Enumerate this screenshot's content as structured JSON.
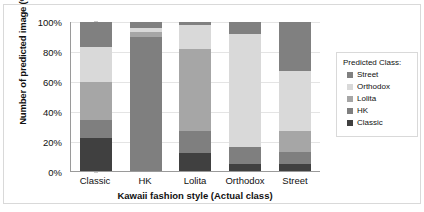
{
  "chart_data": {
    "type": "bar",
    "stacked": true,
    "stack_mode": "percent",
    "title": "",
    "xlabel": "Kawaii fashion style (Actual class)",
    "ylabel": "Number of predicted image (%)",
    "categories": [
      "Classic",
      "HK",
      "Lolita",
      "Orthodox",
      "Street"
    ],
    "ylim": [
      0,
      100
    ],
    "ytick_labels": [
      "0%",
      "20%",
      "40%",
      "60%",
      "80%",
      "100%"
    ],
    "ytick_values": [
      0,
      20,
      40,
      60,
      80,
      100
    ],
    "grid": true,
    "legend_position": "right",
    "legend_title": "Predicted Class:",
    "series": [
      {
        "name": "Classic",
        "color": "#404040",
        "values": [
          22,
          0,
          12,
          5,
          5
        ]
      },
      {
        "name": "HK",
        "color": "#7f7f7f",
        "values": [
          12,
          90,
          15,
          11,
          8
        ]
      },
      {
        "name": "Lolita",
        "color": "#a6a6a6",
        "values": [
          26,
          3,
          55,
          0,
          14
        ]
      },
      {
        "name": "Orthodox",
        "color": "#d9d9d9",
        "values": [
          23,
          3,
          16,
          76,
          40
        ]
      },
      {
        "name": "Street",
        "color": "#808080",
        "values": [
          17,
          4,
          2,
          8,
          33
        ]
      }
    ],
    "legend_order": [
      "Street",
      "Orthodox",
      "Lolita",
      "HK",
      "Classic"
    ]
  },
  "legend": {
    "title": "Predicted Class:",
    "items": [
      {
        "label": "Street",
        "color": "#808080"
      },
      {
        "label": "Orthodox",
        "color": "#d9d9d9"
      },
      {
        "label": "Lolita",
        "color": "#a6a6a6"
      },
      {
        "label": "HK",
        "color": "#7f7f7f"
      },
      {
        "label": "Classic",
        "color": "#404040"
      }
    ]
  },
  "axes": {
    "y_title": "Number of predicted image (%)",
    "x_title": "Kawaii fashion style (Actual class)"
  }
}
